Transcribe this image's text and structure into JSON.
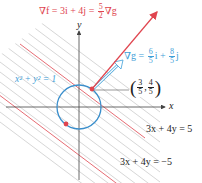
{
  "figure": {
    "gradient_f_label": {
      "prefix": "∇f = 3i + 4j = ",
      "frac_num": "5",
      "frac_den": "2",
      "suffix": "∇g"
    },
    "gradient_g_label": {
      "prefix": "∇g = ",
      "frac1_num": "6",
      "frac1_den": "5",
      "mid": "i + ",
      "frac2_num": "8",
      "frac2_den": "5",
      "suffix": "j"
    },
    "point_label": {
      "x_num": "3",
      "x_den": "5",
      "y_num": "4",
      "y_den": "5"
    },
    "circle_label": "x² + y² = 1",
    "axis_x_label": "x",
    "axis_y_label": "y",
    "line_upper_label": "3x + 4y = 5",
    "line_lower_label": "3x + 4y = −5",
    "colors": {
      "red": "#e0454f",
      "blue": "#3fa0d8",
      "gray_lines": "#bdbdbd",
      "axis": "#444444"
    }
  }
}
